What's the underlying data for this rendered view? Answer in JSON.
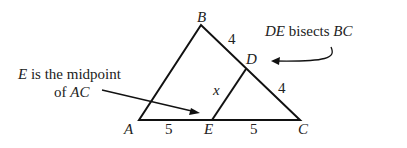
{
  "vertices": {
    "A": "A",
    "B": "B",
    "C": "C",
    "D": "D",
    "E": "E"
  },
  "segment_labels": {
    "BD": "4",
    "DC": "4",
    "AE": "5",
    "EC": "5",
    "DE": "x"
  },
  "annotations": {
    "de_bisects": {
      "italic1": "DE",
      "text1": " bisects ",
      "italic2": "BC"
    },
    "e_midpoint": {
      "italic1": "E",
      "line1": " is the midpoint",
      "line2": "of ",
      "italic2": "AC"
    }
  }
}
